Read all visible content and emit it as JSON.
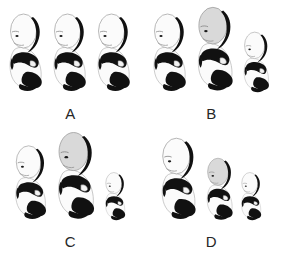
{
  "image": {
    "kind": "scientific-figure-plate",
    "description": "Four-panel plate of fetal ultrasound-style line illustrations",
    "background_color": "#ffffff",
    "grid": {
      "columns": 2,
      "rows": 2
    },
    "ink_color": "#111111",
    "body_color": "#fbfbfb",
    "shaded_head_color": "#d9d9d9",
    "outline_color": "#1a1a1a",
    "label_color": "#262626"
  },
  "panels": [
    {
      "label": "A",
      "name": "panel-a",
      "caption_position": "bottom-center",
      "specimens": [
        {
          "name": "specimen-a-1",
          "scale": 1.0,
          "head_shaded": false,
          "flipped": false
        },
        {
          "name": "specimen-a-2",
          "scale": 1.0,
          "head_shaded": false,
          "flipped": false
        },
        {
          "name": "specimen-a-3",
          "scale": 1.0,
          "head_shaded": false,
          "flipped": false
        }
      ]
    },
    {
      "label": "B",
      "name": "panel-b",
      "caption_position": "bottom-center",
      "specimens": [
        {
          "name": "specimen-b-1",
          "scale": 1.0,
          "head_shaded": false,
          "flipped": false
        },
        {
          "name": "specimen-b-2",
          "scale": 1.08,
          "head_shaded": true,
          "flipped": false
        },
        {
          "name": "specimen-b-3",
          "scale": 0.78,
          "head_shaded": false,
          "flipped": false
        }
      ]
    },
    {
      "label": "C",
      "name": "panel-c",
      "caption_position": "bottom-center",
      "specimens": [
        {
          "name": "specimen-c-1",
          "scale": 0.95,
          "head_shaded": false,
          "flipped": false
        },
        {
          "name": "specimen-c-2",
          "scale": 1.12,
          "head_shaded": true,
          "flipped": false
        },
        {
          "name": "specimen-c-3",
          "scale": 0.62,
          "head_shaded": false,
          "flipped": false
        }
      ]
    },
    {
      "label": "D",
      "name": "panel-d",
      "caption_position": "bottom-center",
      "specimens": [
        {
          "name": "specimen-d-1",
          "scale": 1.05,
          "head_shaded": false,
          "flipped": false
        },
        {
          "name": "specimen-d-2",
          "scale": 0.8,
          "head_shaded": true,
          "flipped": false
        },
        {
          "name": "specimen-d-3",
          "scale": 0.62,
          "head_shaded": false,
          "flipped": false
        }
      ]
    }
  ]
}
